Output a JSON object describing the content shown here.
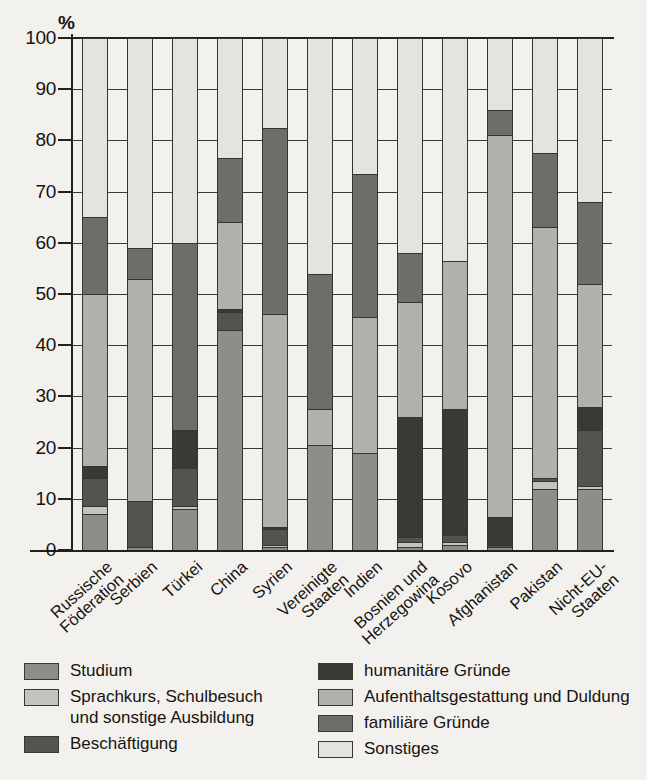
{
  "chart_data": {
    "type": "bar",
    "subtype": "stacked-bar-100-percent",
    "title": "",
    "xlabel": "",
    "ylabel": "%",
    "y_unit": "%",
    "ylim": [
      0,
      100
    ],
    "yticks": [
      0,
      10,
      20,
      30,
      40,
      50,
      60,
      70,
      80,
      90,
      100
    ],
    "ytick_labels": [
      "0",
      "10",
      "20",
      "30",
      "40",
      "50",
      "60",
      "70",
      "80",
      "90",
      "100"
    ],
    "grid": true,
    "legend_position": "bottom",
    "categories": [
      "Russische Föderation",
      "Serbien",
      "Türkei",
      "China",
      "Syrien",
      "Vereinigte Staaten",
      "Indien",
      "Bosnien und Herzegowina",
      "Kosovo",
      "Afghanistan",
      "Pakistan",
      "Nicht-EU-Staaten"
    ],
    "category_lines": [
      [
        "Russische",
        "Föderation"
      ],
      [
        "Serbien",
        ""
      ],
      [
        "Türkei",
        ""
      ],
      [
        "China",
        ""
      ],
      [
        "Syrien",
        ""
      ],
      [
        "Vereinigte",
        "Staaten"
      ],
      [
        "Indien",
        ""
      ],
      [
        "Bosnien und",
        "Herzegowina"
      ],
      [
        "Kosovo",
        ""
      ],
      [
        "Afghanistan",
        ""
      ],
      [
        "Pakistan",
        ""
      ],
      [
        "Nicht-EU-",
        "Staaten"
      ]
    ],
    "series": [
      {
        "name": "Studium",
        "key": "studium",
        "color": "#8d8d8a",
        "values": [
          7,
          0.5,
          8,
          43,
          0.5,
          20.5,
          19,
          0.5,
          1,
          0.5,
          12,
          12
        ]
      },
      {
        "name": "Sprachkurs, Schulbesuch und sonstige Ausbildung",
        "key": "sprachkurs",
        "color": "#c3c3bf",
        "values": [
          1.5,
          0,
          0.5,
          0,
          0.5,
          0,
          0,
          1,
          0.5,
          0,
          1.5,
          0.5
        ]
      },
      {
        "name": "Beschäftigung",
        "key": "beschaeftigung",
        "color": "#55534f",
        "values": [
          5.5,
          9,
          7.5,
          3.5,
          3,
          0,
          0,
          1,
          1.5,
          0.5,
          0.5,
          11
        ]
      },
      {
        "name": "humanitäre Gründe",
        "key": "humanitaere",
        "color": "#3b3936",
        "values": [
          2.5,
          0,
          7.5,
          0.5,
          0.5,
          0,
          0,
          23.5,
          24.5,
          5.5,
          0,
          4.5
        ]
      },
      {
        "name": "Aufenthaltsgestattung und Duldung",
        "key": "aufenthaltsgestattung",
        "color": "#b0b0ac",
        "values": [
          33.5,
          43.5,
          0,
          17,
          41.5,
          7,
          26.5,
          22.5,
          29,
          74.5,
          49,
          24
        ]
      },
      {
        "name": "familiäre Gründe",
        "key": "familiaere",
        "color": "#6f6d69",
        "values": [
          15,
          6,
          36.5,
          12.5,
          36.5,
          26.5,
          28,
          9.5,
          0,
          5,
          14.5,
          16
        ]
      },
      {
        "name": "Sonstiges",
        "key": "sonstiges",
        "color": "#e4e3de",
        "values": [
          35,
          41,
          40,
          23.5,
          17.5,
          46,
          26.5,
          42,
          43.5,
          14,
          22.5,
          32
        ]
      }
    ]
  },
  "legend": {
    "left_column": [
      {
        "label": "Studium",
        "key": "studium"
      },
      {
        "label": "Sprachkurs, Schulbesuch",
        "label_line2": "und sonstige Ausbildung",
        "key": "sprachkurs"
      },
      {
        "label": "Beschäftigung",
        "key": "beschaeftigung"
      }
    ],
    "right_column": [
      {
        "label": "humanitäre Gründe",
        "key": "humanitaere"
      },
      {
        "label": "Aufenthaltsgestattung und Duldung",
        "key": "aufenthaltsgestattung"
      },
      {
        "label": "familiäre Gründe",
        "key": "familiaere"
      },
      {
        "label": "Sonstiges",
        "key": "sonstiges"
      }
    ]
  },
  "colors": {
    "background": "#f2f1ee",
    "axis": "#23201d",
    "gridline": "#3c3935",
    "text": "#16130f"
  }
}
